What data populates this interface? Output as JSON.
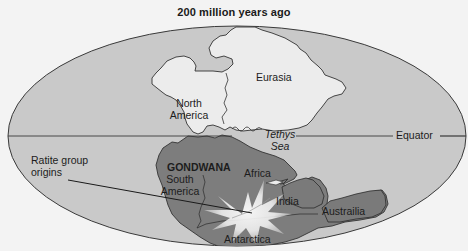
{
  "map": {
    "title": "200 million years ago",
    "projection": "oval world map",
    "colors": {
      "background": "#f3f3f3",
      "ocean": "#c9c9c9",
      "laurasia_land": "#ececec",
      "gondwana_land": "#7d7d7d",
      "outline": "#3a3a3a",
      "burst": "#f5f5f5"
    },
    "labels": {
      "north_america_line1": "North",
      "north_america_line2": "America",
      "eurasia": "Eurasia",
      "tethys_line1": "Tethys",
      "tethys_line2": "Sea",
      "equator": "Equator",
      "gondwana": "GONDWANA",
      "south_america_line1": "South",
      "south_america_line2": "America",
      "africa": "Africa",
      "india": "India",
      "australia": "Austrailia",
      "antarctica": "Antarctica",
      "callout_line1": "Ratite group",
      "callout_line2": "origins"
    },
    "features": [
      {
        "name": "North America",
        "type": "landmass",
        "group": "Laurasia"
      },
      {
        "name": "Eurasia",
        "type": "landmass",
        "group": "Laurasia"
      },
      {
        "name": "Tethys Sea",
        "type": "sea"
      },
      {
        "name": "Equator",
        "type": "reference-line"
      },
      {
        "name": "GONDWANA",
        "type": "supercontinent"
      },
      {
        "name": "South America",
        "type": "landmass",
        "group": "Gondwana"
      },
      {
        "name": "Africa",
        "type": "landmass",
        "group": "Gondwana"
      },
      {
        "name": "India",
        "type": "landmass",
        "group": "Gondwana"
      },
      {
        "name": "Austrailia",
        "type": "landmass",
        "group": "Gondwana"
      },
      {
        "name": "Antarctica",
        "type": "landmass",
        "group": "Gondwana"
      },
      {
        "name": "Ratite group origins",
        "type": "callout"
      }
    ]
  }
}
